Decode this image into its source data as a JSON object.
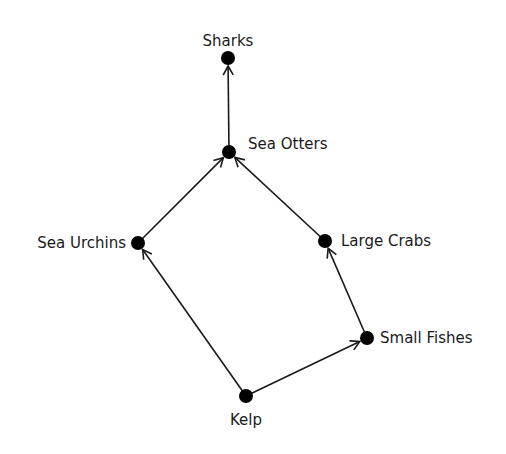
{
  "diagram": {
    "type": "food-web",
    "nodes": [
      {
        "id": "sharks",
        "label": "Sharks",
        "x": 228,
        "y": 58,
        "lx": 228,
        "ly": 46,
        "anchor": "middle"
      },
      {
        "id": "sea-otters",
        "label": "Sea Otters",
        "x": 229,
        "y": 152,
        "lx": 248,
        "ly": 149,
        "anchor": "start"
      },
      {
        "id": "sea-urchins",
        "label": "Sea Urchins",
        "x": 138,
        "y": 243,
        "lx": 126,
        "ly": 248,
        "anchor": "end"
      },
      {
        "id": "large-crabs",
        "label": "Large Crabs",
        "x": 325,
        "y": 241,
        "lx": 341,
        "ly": 246,
        "anchor": "start"
      },
      {
        "id": "small-fishes",
        "label": "Small Fishes",
        "x": 367,
        "y": 338,
        "lx": 380,
        "ly": 343,
        "anchor": "start"
      },
      {
        "id": "kelp",
        "label": "Kelp",
        "x": 246,
        "y": 396,
        "lx": 246,
        "ly": 425,
        "anchor": "middle"
      }
    ],
    "edges": [
      {
        "from": "sea-otters",
        "to": "sharks"
      },
      {
        "from": "sea-urchins",
        "to": "sea-otters"
      },
      {
        "from": "large-crabs",
        "to": "sea-otters"
      },
      {
        "from": "kelp",
        "to": "sea-urchins"
      },
      {
        "from": "kelp",
        "to": "small-fishes"
      },
      {
        "from": "small-fishes",
        "to": "large-crabs"
      }
    ],
    "colors": {
      "node": "#000000",
      "edge": "#1a1a1a",
      "text": "#1a1a1a"
    }
  }
}
